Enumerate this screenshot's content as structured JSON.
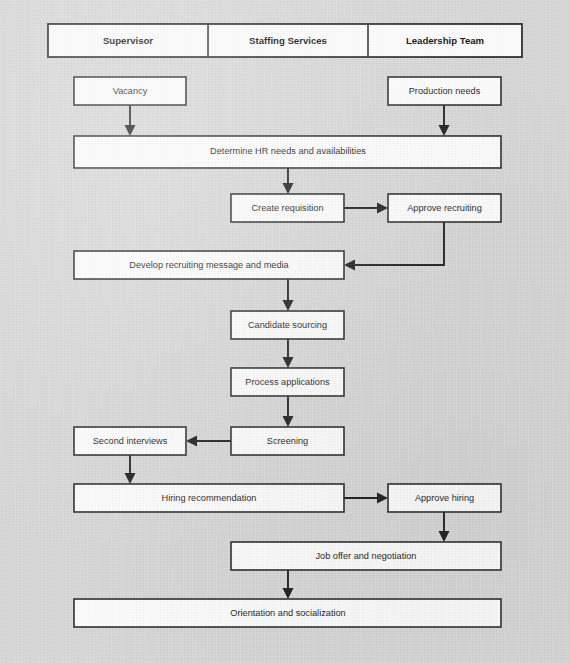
{
  "document": {
    "title": "HR Recruiting and Hiring Process Flowchart",
    "background_color": "#d9d9d9",
    "box_fill_color": "#ffffff",
    "line_color": "#1f1f1f"
  },
  "swimlane_header": {
    "columns": [
      {
        "label": "Supervisor"
      },
      {
        "label": "Staffing Services"
      },
      {
        "label": "Leadership Team"
      }
    ]
  },
  "nodes": [
    {
      "id": "vacancy",
      "label": "Vacancy"
    },
    {
      "id": "production-needs",
      "label": "Production needs"
    },
    {
      "id": "determine-hr",
      "label": "Determine HR needs and availabilities"
    },
    {
      "id": "create-requisition",
      "label": "Create requisition"
    },
    {
      "id": "approve-recruiting",
      "label": "Approve recruiting"
    },
    {
      "id": "develop-recruiting",
      "label": "Develop recruiting message and media"
    },
    {
      "id": "candidate-sourcing",
      "label": "Candidate sourcing"
    },
    {
      "id": "process-apps",
      "label": "Process applications"
    },
    {
      "id": "screening",
      "label": "Screening"
    },
    {
      "id": "second-interviews",
      "label": "Second interviews"
    },
    {
      "id": "hiring-recommend",
      "label": "Hiring recommendation"
    },
    {
      "id": "approve-hiring",
      "label": "Approve hiring"
    },
    {
      "id": "job-offer",
      "label": "Job offer and negotiation"
    },
    {
      "id": "orientation",
      "label": "Orientation and socialization"
    }
  ],
  "edges": [
    {
      "from": "vacancy",
      "to": "determine-hr"
    },
    {
      "from": "production-needs",
      "to": "determine-hr"
    },
    {
      "from": "determine-hr",
      "to": "create-requisition"
    },
    {
      "from": "create-requisition",
      "to": "approve-recruiting"
    },
    {
      "from": "approve-recruiting",
      "to": "develop-recruiting"
    },
    {
      "from": "develop-recruiting",
      "to": "candidate-sourcing"
    },
    {
      "from": "candidate-sourcing",
      "to": "process-apps"
    },
    {
      "from": "process-apps",
      "to": "screening"
    },
    {
      "from": "screening",
      "to": "second-interviews"
    },
    {
      "from": "second-interviews",
      "to": "hiring-recommend"
    },
    {
      "from": "hiring-recommend",
      "to": "approve-hiring"
    },
    {
      "from": "approve-hiring",
      "to": "job-offer"
    },
    {
      "from": "job-offer",
      "to": "orientation"
    }
  ]
}
